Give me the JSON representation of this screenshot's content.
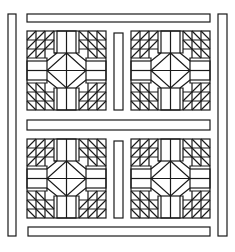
{
  "figure": {
    "blocks": [
      {
        "id": "block-top-left",
        "x": 27,
        "y": 31,
        "size": 79
      },
      {
        "id": "block-top-right",
        "x": 131,
        "y": 31,
        "size": 79
      },
      {
        "id": "block-bottom-left",
        "x": 27,
        "y": 139,
        "size": 79
      },
      {
        "id": "block-bottom-right",
        "x": 131,
        "y": 139,
        "size": 79
      }
    ],
    "sashing": {
      "top_border": {
        "x": 27,
        "y": 14,
        "w": 183,
        "h": 8
      },
      "bottom_border": {
        "x": 28,
        "y": 227,
        "w": 182,
        "h": 9
      },
      "left_border": {
        "x": 8,
        "y": 14,
        "w": 8,
        "h": 222
      },
      "right_border": {
        "x": 218,
        "y": 14,
        "w": 9,
        "h": 222
      },
      "middle_horizontal": {
        "x": 27,
        "y": 120,
        "w": 183,
        "h": 10
      },
      "middle_vertical_top": {
        "x": 114,
        "y": 33,
        "w": 9,
        "h": 77
      },
      "middle_vertical_bottom": {
        "x": 114,
        "y": 141,
        "w": 9,
        "h": 77
      }
    },
    "stroke_color": "#1a1a1a",
    "background_color": "#ffffff"
  }
}
